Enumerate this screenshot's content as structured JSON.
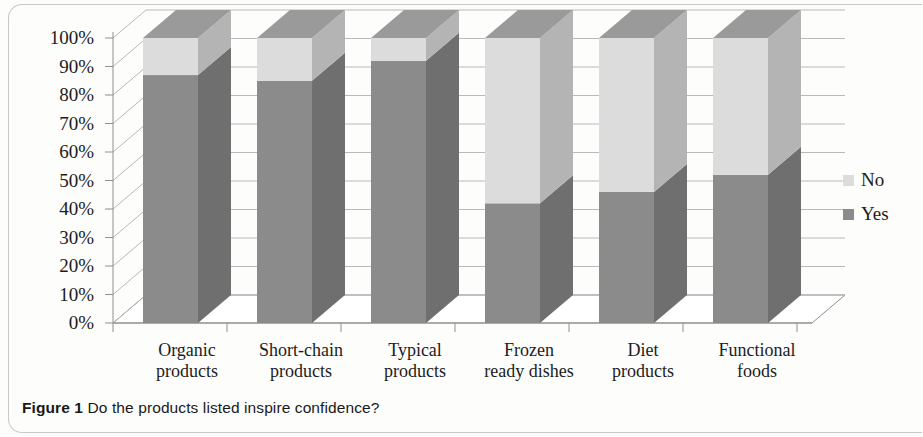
{
  "caption": {
    "label": "Figure 1",
    "text": "Do the products listed inspire confidence?"
  },
  "legend": {
    "position": "right",
    "items": [
      {
        "label": "No",
        "color": "#dcdcdc"
      },
      {
        "label": "Yes",
        "color": "#8b8b8b"
      }
    ]
  },
  "axis": {
    "yticks": [
      "100%",
      "90%",
      "80%",
      "70%",
      "60%",
      "50%",
      "40%",
      "30%",
      "20%",
      "10%",
      "0%"
    ]
  },
  "colors": {
    "yes_front": "#8b8b8b",
    "yes_side": "#6f6f6f",
    "no_front": "#dcdcdc",
    "no_side": "#b4b4b4",
    "no_top": "#9a9a9a",
    "grid": "#b9b9b9",
    "axis": "#8f8f8f",
    "text": "#1c1c1c",
    "frame": "#c9c9c9"
  },
  "chart_data": {
    "type": "bar",
    "subtype": "stacked-100-percent-3d",
    "title": "Do the products listed inspire confidence?",
    "xlabel": "",
    "ylabel": "",
    "ylim": [
      0,
      100
    ],
    "yticks": [
      0,
      10,
      20,
      30,
      40,
      50,
      60,
      70,
      80,
      90,
      100
    ],
    "ytick_labels": [
      "0%",
      "10%",
      "20%",
      "30%",
      "40%",
      "50%",
      "60%",
      "70%",
      "80%",
      "90%",
      "100%"
    ],
    "grid": true,
    "legend_position": "right",
    "categories": [
      "Organic products",
      "Short-chain products",
      "Typical products",
      "Frozen ready dishes",
      "Diet products",
      "Functional foods"
    ],
    "category_lines": [
      [
        "Organic",
        "products"
      ],
      [
        "Short-chain",
        "products"
      ],
      [
        "Typical",
        "products"
      ],
      [
        "Frozen",
        "ready dishes"
      ],
      [
        "Diet",
        "products"
      ],
      [
        "Functional",
        "foods"
      ]
    ],
    "series": [
      {
        "name": "Yes",
        "color": "#8b8b8b",
        "values": [
          87,
          85,
          92,
          42,
          46,
          52
        ]
      },
      {
        "name": "No",
        "color": "#dcdcdc",
        "values": [
          13,
          15,
          8,
          58,
          54,
          48
        ]
      }
    ]
  }
}
